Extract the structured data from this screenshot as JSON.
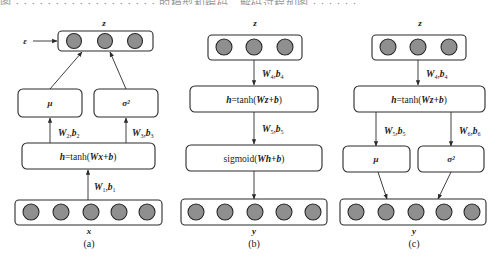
{
  "header_fragment": "图 · · · · · · · · · · · · · · · · · · 的模型和编码，解码过程如图 · · · · · ·",
  "panels": {
    "a": {
      "caption": "(a)",
      "top_layer_label": "z",
      "noise_label": "ε",
      "mu_label": "μ",
      "sigma_label": "σ²",
      "hidden_label_h": "h",
      "hidden_label_fn": "=tanh(",
      "hidden_label_arg": "Wx+b",
      "hidden_label_close": ")",
      "edge_mu": {
        "W": "W",
        "Wsub": "2",
        "b": "b",
        "bsub": "2"
      },
      "edge_sigma": {
        "W": "W",
        "Wsub": "3",
        "b": "b",
        "bsub": "3"
      },
      "edge_in": {
        "W": "W",
        "Wsub": "1",
        "b": "b",
        "bsub": "1"
      },
      "bottom_layer_label": "x",
      "top_nodes": 3,
      "bottom_nodes": 5
    },
    "b": {
      "caption": "(b)",
      "top_layer_label": "z",
      "hidden_label_h": "h",
      "hidden_label_fn": "=tanh(",
      "hidden_label_arg": "Wz+b",
      "hidden_label_close": ")",
      "out_label_fn": "sigmoid(",
      "out_label_arg": "Wh+b",
      "out_label_close": ")",
      "edge_top": {
        "W": "W",
        "Wsub": "4",
        "b": "b",
        "bsub": "4"
      },
      "edge_mid": {
        "W": "W",
        "Wsub": "5",
        "b": "b",
        "bsub": "5"
      },
      "bottom_layer_label": "y",
      "top_nodes": 3,
      "bottom_nodes": 5
    },
    "c": {
      "caption": "(c)",
      "top_layer_label": "z",
      "hidden_label_h": "h",
      "hidden_label_fn": "=tanh(",
      "hidden_label_arg": "Wz+b",
      "hidden_label_close": ")",
      "mu_label": "μ",
      "sigma_label": "σ²",
      "edge_top": {
        "W": "W",
        "Wsub": "4",
        "b": "b",
        "bsub": "4"
      },
      "edge_mu": {
        "W": "W",
        "Wsub": "5",
        "b": "b",
        "bsub": "5"
      },
      "edge_sigma": {
        "W": "W",
        "Wsub": "6",
        "b": "b",
        "bsub": "6"
      },
      "bottom_layer_label": "y",
      "top_nodes": 3,
      "bottom_nodes": 5
    }
  },
  "colors": {
    "node_fill": "#8f8f8f",
    "stroke": "#2a2a2a",
    "background": "#ffffff"
  }
}
